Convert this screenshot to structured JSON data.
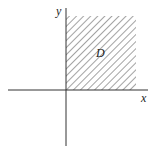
{
  "diagram": {
    "region_label": "D",
    "x_axis_label": "x",
    "y_axis_label": "y",
    "colors": {
      "axis": "#333333",
      "hatch": "#555555",
      "background": "#ffffff"
    }
  }
}
